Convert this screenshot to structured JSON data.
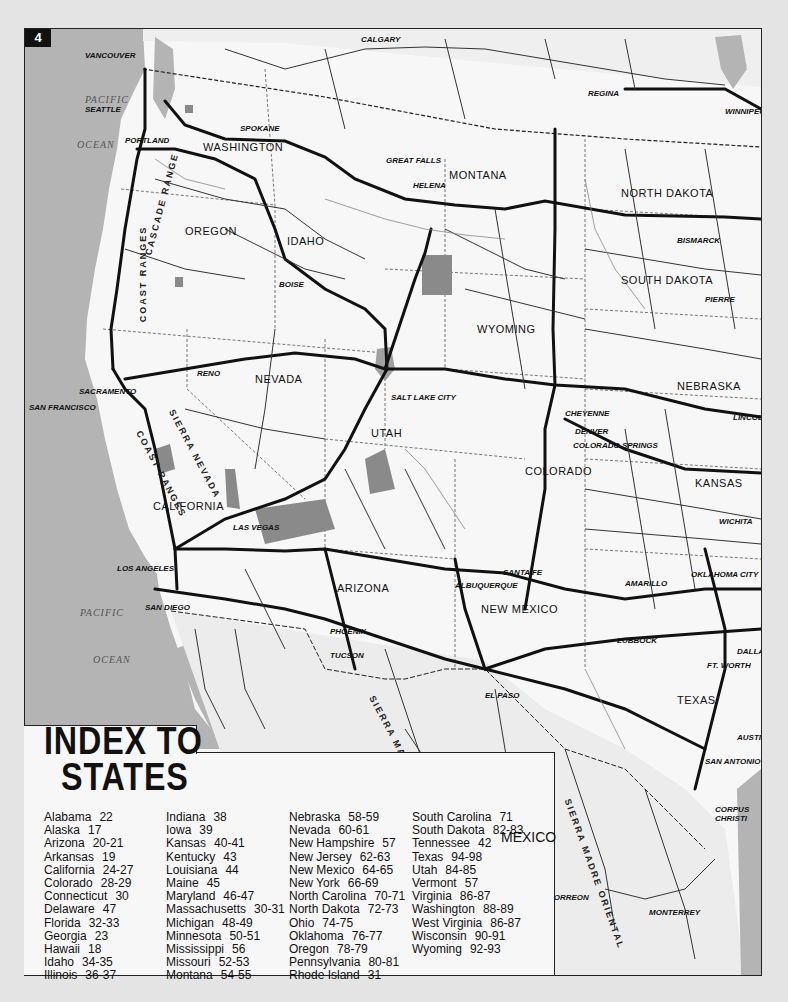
{
  "page": {
    "number": "4",
    "colors": {
      "land": "#f7f7f7",
      "water": "#b4b4b4",
      "mexico": "#e6e6e6",
      "road": "#111111",
      "park": "#8a8a8a",
      "background": "#e4e4e4"
    }
  },
  "map": {
    "water_labels": [
      {
        "text": "PACIFIC",
        "x": 60,
        "y": 95
      },
      {
        "text": "OCEAN",
        "x": 55,
        "y": 115
      },
      {
        "text": "PACIFIC",
        "x": 55,
        "y": 580
      },
      {
        "text": "OCEAN",
        "x": 68,
        "y": 632
      }
    ],
    "states": [
      {
        "name": "WASHINGTON",
        "x": 182,
        "y": 112
      },
      {
        "name": "OREGON",
        "x": 160,
        "y": 196
      },
      {
        "name": "IDAHO",
        "x": 262,
        "y": 206
      },
      {
        "name": "MONTANA",
        "x": 428,
        "y": 142
      },
      {
        "name": "NORTH DAKOTA",
        "x": 596,
        "y": 158
      },
      {
        "name": "SOUTH DAKOTA",
        "x": 596,
        "y": 245
      },
      {
        "name": "WYOMING",
        "x": 452,
        "y": 294
      },
      {
        "name": "NEBRASKA",
        "x": 652,
        "y": 351
      },
      {
        "name": "NEVADA",
        "x": 230,
        "y": 344
      },
      {
        "name": "UTAH",
        "x": 348,
        "y": 400
      },
      {
        "name": "COLORADO",
        "x": 500,
        "y": 438
      },
      {
        "name": "KANSAS",
        "x": 670,
        "y": 448
      },
      {
        "name": "CALIFORNIA",
        "x": 130,
        "y": 471
      },
      {
        "name": "ARIZONA",
        "x": 312,
        "y": 554
      },
      {
        "name": "NEW MEXICO",
        "x": 456,
        "y": 574
      },
      {
        "name": "TEXAS",
        "x": 652,
        "y": 667
      }
    ],
    "cities": [
      {
        "name": "VANCOUVER",
        "x": 60,
        "y": 22
      },
      {
        "name": "CALGARY",
        "x": 336,
        "y": 6
      },
      {
        "name": "REGINA",
        "x": 563,
        "y": 60
      },
      {
        "name": "WINNIPEG",
        "x": 726,
        "y": 80
      },
      {
        "name": "SEATTLE",
        "x": 60,
        "y": 76
      },
      {
        "name": "SPOKANE",
        "x": 215,
        "y": 95
      },
      {
        "name": "PORTLAND",
        "x": 102,
        "y": 107
      },
      {
        "name": "GREAT FALLS",
        "x": 361,
        "y": 127
      },
      {
        "name": "HELENA",
        "x": 388,
        "y": 152
      },
      {
        "name": "BISMARCK",
        "x": 654,
        "y": 207
      },
      {
        "name": "BOISE",
        "x": 254,
        "y": 251
      },
      {
        "name": "PIERRE",
        "x": 680,
        "y": 266
      },
      {
        "name": "RENO",
        "x": 172,
        "y": 341
      },
      {
        "name": "SACRAMENTO",
        "x": 54,
        "y": 359
      },
      {
        "name": "SAN FRANCISCO",
        "x": 5,
        "y": 375
      },
      {
        "name": "SALT LAKE CITY",
        "x": 366,
        "y": 364
      },
      {
        "name": "CHEYENNE",
        "x": 544,
        "y": 380
      },
      {
        "name": "LINCOLN",
        "x": 718,
        "y": 386
      },
      {
        "name": "DENVER",
        "x": 550,
        "y": 399
      },
      {
        "name": "COLORADO SPRINGS",
        "x": 548,
        "y": 412
      },
      {
        "name": "WICHITA",
        "x": 712,
        "y": 488
      },
      {
        "name": "LAS VEGAS",
        "x": 208,
        "y": 494
      },
      {
        "name": "LOS ANGELES",
        "x": 92,
        "y": 535
      },
      {
        "name": "SANTA FE",
        "x": 478,
        "y": 539
      },
      {
        "name": "OKLAHOMA CITY",
        "x": 688,
        "y": 541
      },
      {
        "name": "ALBUQUERQUE",
        "x": 440,
        "y": 552
      },
      {
        "name": "AMARILLO",
        "x": 602,
        "y": 550
      },
      {
        "name": "SAN DIEGO",
        "x": 120,
        "y": 574
      },
      {
        "name": "PHOENIX",
        "x": 305,
        "y": 598
      },
      {
        "name": "LUBBOCK",
        "x": 592,
        "y": 607
      },
      {
        "name": "TUCSON",
        "x": 305,
        "y": 622
      },
      {
        "name": "FT. WORTH",
        "x": 702,
        "y": 630
      },
      {
        "name": "DALLAS",
        "x": 722,
        "y": 628
      },
      {
        "name": "EL PASO",
        "x": 460,
        "y": 662
      },
      {
        "name": "AUSTIN",
        "x": 730,
        "y": 704
      },
      {
        "name": "SAN ANTONIO",
        "x": 698,
        "y": 728
      },
      {
        "name": "CHIHUAHUA",
        "x": 432,
        "y": 786
      },
      {
        "name": "CORPUS CHRISTI",
        "x": 736,
        "y": 774
      },
      {
        "name": "TORREON",
        "x": 524,
        "y": 864
      },
      {
        "name": "MONTERREY",
        "x": 624,
        "y": 879
      }
    ],
    "ranges": [
      {
        "text": "COAST RANGES",
        "x": 92,
        "y": 222,
        "rot": -90
      },
      {
        "text": "CASCADE RANGE",
        "x": 92,
        "y": 200,
        "rot": -75
      },
      {
        "text": "COAST RANGES",
        "x": 108,
        "y": 430,
        "rot": 62
      },
      {
        "text": "SIERRA NEVADA",
        "x": 130,
        "y": 420,
        "rot": 62
      },
      {
        "text": "SIERRA MADRE OCCIDENTAL",
        "x": 335,
        "y": 750,
        "rot": 62
      },
      {
        "text": "SIERRA MADRE ORIENTAL",
        "x": 520,
        "y": 835,
        "rot": 70
      }
    ],
    "country_labels": [
      {
        "text": "MEXICO",
        "x": 476,
        "y": 800
      }
    ]
  },
  "index": {
    "title_line1": "INDEX TO",
    "title_line2": "STATES",
    "columns": [
      [
        {
          "state": "Alabama",
          "pages": "22"
        },
        {
          "state": "Alaska",
          "pages": "17"
        },
        {
          "state": "Arizona",
          "pages": "20-21"
        },
        {
          "state": "Arkansas",
          "pages": "19"
        },
        {
          "state": "California",
          "pages": "24-27"
        },
        {
          "state": "Colorado",
          "pages": "28-29"
        },
        {
          "state": "Connecticut",
          "pages": "30"
        },
        {
          "state": "Delaware",
          "pages": "47"
        },
        {
          "state": "Florida",
          "pages": "32-33"
        },
        {
          "state": "Georgia",
          "pages": "23"
        },
        {
          "state": "Hawaii",
          "pages": "18"
        },
        {
          "state": "Idaho",
          "pages": "34-35"
        },
        {
          "state": "Illinois",
          "pages": "36-37"
        }
      ],
      [
        {
          "state": "Indiana",
          "pages": "38"
        },
        {
          "state": "Iowa",
          "pages": "39"
        },
        {
          "state": "Kansas",
          "pages": "40-41"
        },
        {
          "state": "Kentucky",
          "pages": "43"
        },
        {
          "state": "Louisiana",
          "pages": "44"
        },
        {
          "state": "Maine",
          "pages": "45"
        },
        {
          "state": "Maryland",
          "pages": "46-47"
        },
        {
          "state": "Massachusetts",
          "pages": "30-31"
        },
        {
          "state": "Michigan",
          "pages": "48-49"
        },
        {
          "state": "Minnesota",
          "pages": "50-51"
        },
        {
          "state": "Mississippi",
          "pages": "56"
        },
        {
          "state": "Missouri",
          "pages": "52-53"
        },
        {
          "state": "Montana",
          "pages": "54-55"
        }
      ],
      [
        {
          "state": "Nebraska",
          "pages": "58-59"
        },
        {
          "state": "Nevada",
          "pages": "60-61"
        },
        {
          "state": "New Hampshire",
          "pages": "57"
        },
        {
          "state": "New Jersey",
          "pages": "62-63"
        },
        {
          "state": "New Mexico",
          "pages": "64-65"
        },
        {
          "state": "New York",
          "pages": "66-69"
        },
        {
          "state": "North Carolina",
          "pages": "70-71"
        },
        {
          "state": "North Dakota",
          "pages": "72-73"
        },
        {
          "state": "Ohio",
          "pages": "74-75"
        },
        {
          "state": "Oklahoma",
          "pages": "76-77"
        },
        {
          "state": "Oregon",
          "pages": "78-79"
        },
        {
          "state": "Pennsylvania",
          "pages": "80-81"
        },
        {
          "state": "Rhode Island",
          "pages": "31"
        }
      ],
      [
        {
          "state": "South Carolina",
          "pages": "71"
        },
        {
          "state": "South Dakota",
          "pages": "82-83"
        },
        {
          "state": "Tennessee",
          "pages": "42"
        },
        {
          "state": "Texas",
          "pages": "94-98"
        },
        {
          "state": "Utah",
          "pages": "84-85"
        },
        {
          "state": "Vermont",
          "pages": "57"
        },
        {
          "state": "Virginia",
          "pages": "86-87"
        },
        {
          "state": "Washington",
          "pages": "88-89"
        },
        {
          "state": "West Virginia",
          "pages": "86-87"
        },
        {
          "state": "Wisconsin",
          "pages": "90-91"
        },
        {
          "state": "Wyoming",
          "pages": "92-93"
        }
      ]
    ]
  }
}
